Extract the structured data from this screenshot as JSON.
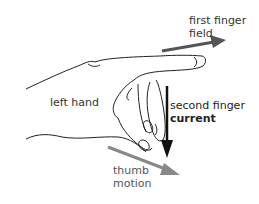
{
  "diagram": {
    "hand_label": "left hand",
    "first_finger": {
      "line1": "first finger",
      "line2": "field",
      "arrow_color": "#555555"
    },
    "second_finger": {
      "line1": "second finger",
      "line2": "current",
      "arrow_color": "#111111"
    },
    "thumb": {
      "line1": "thumb",
      "line2": "motion",
      "arrow_color": "#888888"
    }
  }
}
